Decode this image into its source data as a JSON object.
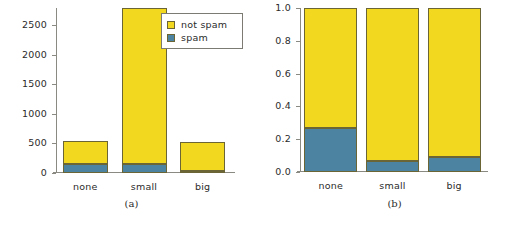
{
  "figure": {
    "panels": [
      {
        "id": "a",
        "caption": "(a)"
      },
      {
        "id": "b",
        "caption": "(b)"
      }
    ]
  },
  "legend": {
    "position": "top-right",
    "items": [
      {
        "label": "not spam",
        "color": "#f2d91f",
        "key": "not_spam"
      },
      {
        "label": "spam",
        "color": "#4b83a0",
        "key": "spam"
      }
    ]
  },
  "colors": {
    "not_spam": "#f2d91f",
    "spam": "#4b83a0",
    "bar_border": "#6b6434",
    "axis": "#8a8a82",
    "text": "#2b2b2b"
  },
  "chart_data": [
    {
      "type": "bar",
      "id": "panel-a",
      "title": "",
      "subtitle": "",
      "caption": "(a)",
      "stacked": true,
      "xlabel": "",
      "ylabel": "",
      "categories": [
        "none",
        "small",
        "big"
      ],
      "yticks": [
        0,
        500,
        1000,
        1500,
        2000,
        2500
      ],
      "yticklabels": [
        "0",
        "500",
        "1000",
        "1500",
        "2000",
        "2500"
      ],
      "ylim": [
        0,
        2790
      ],
      "grid": false,
      "legend_position": "top-right",
      "series": [
        {
          "name": "spam",
          "color": "#4b83a0",
          "values": [
            150,
            160,
            40
          ]
        },
        {
          "name": "not spam",
          "color": "#f2d91f",
          "values": [
            390,
            2630,
            490
          ]
        }
      ],
      "totals": [
        540,
        2790,
        530
      ]
    },
    {
      "type": "bar",
      "id": "panel-b",
      "title": "",
      "subtitle": "",
      "caption": "(b)",
      "stacked": true,
      "normalized": true,
      "xlabel": "",
      "ylabel": "",
      "categories": [
        "none",
        "small",
        "big"
      ],
      "yticks": [
        0.0,
        0.2,
        0.4,
        0.6,
        0.8,
        1.0
      ],
      "yticklabels": [
        "0.0",
        "0.2",
        "0.4",
        "0.6",
        "0.8",
        "1.0"
      ],
      "ylim": [
        0,
        1
      ],
      "grid": false,
      "legend_position": "none",
      "series": [
        {
          "name": "spam",
          "color": "#4b83a0",
          "values": [
            0.27,
            0.065,
            0.09
          ]
        },
        {
          "name": "not spam",
          "color": "#f2d91f",
          "values": [
            0.73,
            0.935,
            0.91
          ]
        }
      ]
    }
  ]
}
